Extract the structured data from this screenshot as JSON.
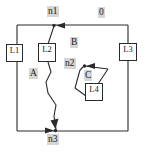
{
  "figure": {
    "background_color": "#ffffff",
    "line_color": "#2b2b2b",
    "label_background_color": "#d6d6d6",
    "text_color": "#1a1a1a"
  },
  "nodes": [
    {
      "id": "n1",
      "label": "n1",
      "x": 54,
      "y": 25
    },
    {
      "id": "n2",
      "label": "n2",
      "x": 73,
      "y": 65
    },
    {
      "id": "n3",
      "label": "n3",
      "x": 54,
      "y": 131
    }
  ],
  "regions": [
    {
      "id": "A",
      "label": "A",
      "x": 32,
      "y": 74
    },
    {
      "id": "B",
      "label": "B",
      "x": 73,
      "y": 43
    },
    {
      "id": "C",
      "label": "C",
      "x": 87,
      "y": 76
    },
    {
      "id": "O",
      "label": "0",
      "x": 101,
      "y": 12
    }
  ],
  "elements": [
    {
      "id": "L1",
      "label": "L1",
      "x": 10,
      "y": 49
    },
    {
      "id": "L2",
      "label": "L2",
      "x": 42,
      "y": 48
    },
    {
      "id": "L3",
      "label": "L3",
      "x": 118,
      "y": 48
    },
    {
      "id": "L4",
      "label": "L4",
      "x": 88,
      "y": 88
    }
  ],
  "edges": [
    {
      "id": "outer-loop",
      "from": "n1",
      "to": "n3",
      "via": [
        "L1"
      ],
      "shape": "rectangle"
    },
    {
      "id": "right-loop",
      "from": "n1",
      "to": "n3",
      "via": [
        "L3"
      ],
      "shape": "rectangle"
    },
    {
      "id": "middle-branch",
      "from": "n1",
      "to": "n3",
      "via": [
        "L2"
      ],
      "shape": "zigzag"
    },
    {
      "id": "c-loop",
      "from": "n2",
      "to": "n2",
      "via": [
        "L4"
      ],
      "shape": "polygon"
    }
  ],
  "arrows": [
    {
      "id": "arrow-into-n1",
      "direction": "left",
      "target": "n1"
    },
    {
      "id": "arrow-into-n3",
      "direction": "right",
      "target": "n3"
    },
    {
      "id": "arrow-into-n2",
      "direction": "left",
      "target": "n2"
    },
    {
      "id": "arrow-branch-into-n3",
      "direction": "down-right",
      "target": "n3"
    }
  ]
}
